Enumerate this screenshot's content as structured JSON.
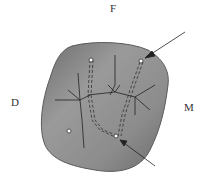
{
  "diagram": {
    "type": "tooth cross-section with root canals",
    "labels": {
      "top": "F",
      "left": "D",
      "right": "M"
    },
    "colors": {
      "section_fill": "#8a8a8a",
      "section_edge": "#5a5a5a",
      "lines": "#222222",
      "background": "#ffffff"
    }
  }
}
